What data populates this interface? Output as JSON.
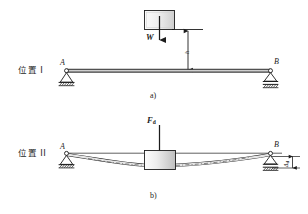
{
  "figure": {
    "title_caption_a": "a)",
    "title_caption_b": "b)",
    "panels": [
      {
        "id": "panel-a",
        "position_label": "位置 I",
        "caption": "a)",
        "support_left_label": "A",
        "support_right_label": "B",
        "support_left_type": "pin-support",
        "support_right_type": "roller-support",
        "load_label": "W",
        "height_dimension_label": "h",
        "block_name": "falling-weight-block",
        "beam_state": "undeformed"
      },
      {
        "id": "panel-b",
        "position_label": "位置 II",
        "caption": "b)",
        "support_left_label": "A",
        "support_right_label": "B",
        "support_left_type": "pin-support",
        "support_right_type": "roller-support",
        "load_label": "F",
        "load_label_sub": "d",
        "deflection_label": "Δ",
        "deflection_label_sub": "d",
        "block_name": "resting-weight-block",
        "beam_state": "deflected"
      }
    ]
  },
  "colors": {
    "line": "#1c1c1c",
    "beam_fill": "#f2f2f2",
    "block_fill_light": "#f7f7f7",
    "block_fill_dark": "#b9b9b9",
    "ground_hatch": "#1c1c1c",
    "dashed_curve": "#4a4a4a"
  }
}
